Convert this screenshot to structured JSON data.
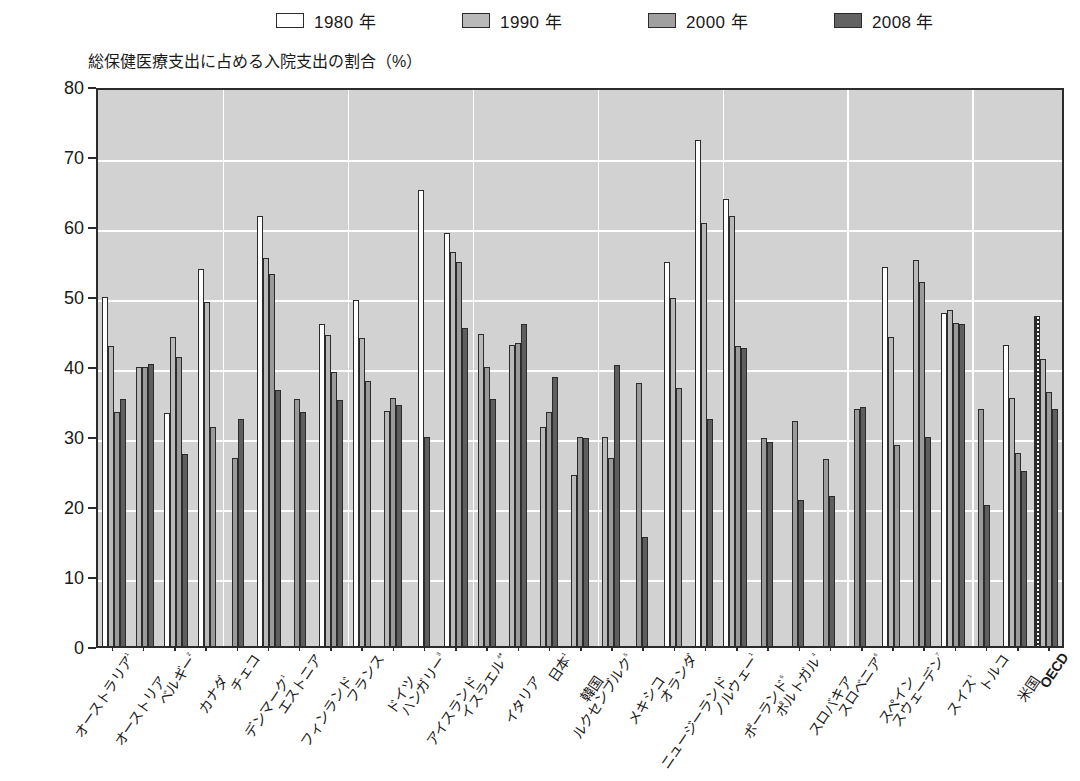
{
  "legend": {
    "items": [
      {
        "label": "1980 年",
        "swatch": "white-swatch",
        "color": "#ffffff"
      },
      {
        "label": "1990 年",
        "swatch": "light-gray-swatch",
        "color": "#b9b9b9"
      },
      {
        "label": "2000 年",
        "swatch": "medium-gray-swatch",
        "color": "#a0a0a0"
      },
      {
        "label": "2008 年",
        "swatch": "dark-gray-swatch",
        "color": "#636363"
      }
    ]
  },
  "axis_title": "総保健医療支出に占める入院支出の割合（%）",
  "chart_data": {
    "type": "bar",
    "title": "総保健医療支出に占める入院支出の割合（%）",
    "xlabel": "",
    "ylabel": "総保健医療支出に占める入院支出の割合（%）",
    "ylim": [
      0,
      80
    ],
    "yticks": [
      0,
      10,
      20,
      30,
      40,
      50,
      60,
      70,
      80
    ],
    "grid": true,
    "legend_position": "top",
    "categories": [
      "オーストラリア¹",
      "オーストリア",
      "ベルギー²",
      "カナダ",
      "チェコ",
      "デンマーク¹",
      "エストニア",
      "フィンランド",
      "フランス",
      "ドイツ",
      "ハンガリー³",
      "アイスランド",
      "イスラエル⁴*",
      "イタリア",
      "日本¹",
      "韓国",
      "ルクセンブルク⁵",
      "メキシコ",
      "オランダ",
      "ニュージーランド",
      "ノルウェー¹",
      "ポーランド⁶",
      "ポルトガル⁴",
      "スロバキア",
      "スロベニア⁶",
      "スペイン",
      "スウェーデン⁷",
      "スイス¹",
      "トルコ",
      "米国",
      "OECD"
    ],
    "series": [
      {
        "name": "1980 年",
        "color": "#ffffff",
        "values": [
          49.8,
          null,
          33.3,
          53.9,
          null,
          61.4,
          null,
          46.0,
          49.4,
          null,
          65.1,
          59.0,
          null,
          null,
          null,
          null,
          null,
          null,
          54.8,
          72.3,
          63.8,
          null,
          null,
          null,
          null,
          54.2,
          null,
          47.6,
          null,
          43.0,
          47.2
        ]
      },
      {
        "name": "1990 年",
        "color": "#b9b9b9",
        "values": [
          42.8,
          39.8,
          44.2,
          49.1,
          null,
          55.4,
          null,
          44.5,
          44.0,
          33.6,
          null,
          56.3,
          44.6,
          43.0,
          31.3,
          24.4,
          29.8,
          null,
          49.7,
          60.5,
          61.5,
          null,
          null,
          null,
          null,
          44.1,
          55.2,
          48.0,
          null,
          35.4,
          41.0
        ]
      },
      {
        "name": "2000 年",
        "color": "#a0a0a0",
        "values": [
          33.5,
          39.8,
          41.3,
          31.3,
          26.8,
          53.2,
          35.3,
          39.2,
          37.8,
          35.4,
          null,
          54.8,
          39.9,
          43.3,
          33.5,
          29.9,
          26.8,
          37.6,
          36.8,
          null,
          42.9,
          29.7,
          32.2,
          26.7,
          33.8,
          28.7,
          52.0,
          46.2,
          33.8,
          27.6,
          36.3
        ]
      },
      {
        "name": "2008 年",
        "color": "#636363",
        "values": [
          35.3,
          40.3,
          27.5,
          null,
          32.5,
          36.6,
          33.4,
          35.2,
          null,
          34.4,
          29.8,
          45.5,
          35.3,
          46.0,
          38.5,
          29.7,
          40.2,
          15.6,
          null,
          32.4,
          42.6,
          29.2,
          20.9,
          21.5,
          34.2,
          null,
          29.9,
          46.0,
          20.2,
          25.0,
          33.9
        ]
      }
    ],
    "extra_bars": {
      "note": "Some groups contain additional intermediate bars",
      "ルクセンブルク⁵_extra": 36.2,
      "ポルトガル⁴_extra": 32.9,
      "ポルトガル⁴_extra2": 24.5,
      "ノルウェー¹_note": "4 bars"
    }
  }
}
